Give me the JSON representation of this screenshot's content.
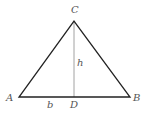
{
  "diagram": {
    "points": {
      "A": {
        "label": "A",
        "x": 19,
        "y": 97
      },
      "B": {
        "label": "B",
        "x": 130,
        "y": 97
      },
      "C": {
        "label": "C",
        "x": 74,
        "y": 21
      },
      "D": {
        "label": "D",
        "x": 74,
        "y": 97
      }
    },
    "segment_labels": {
      "base": "b",
      "height": "h"
    },
    "colors": {
      "triangle": "#222222",
      "altitude": "#888888",
      "label": "#555555"
    }
  }
}
